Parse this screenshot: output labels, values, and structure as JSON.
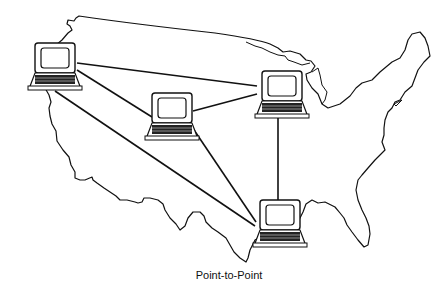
{
  "diagram": {
    "caption": "Point-to-Point",
    "map": "united-states-outline",
    "nodes": [
      {
        "id": "west",
        "label": "computer-west-coast",
        "x": 55,
        "y": 67
      },
      {
        "id": "central",
        "label": "computer-central",
        "x": 172,
        "y": 116
      },
      {
        "id": "northeast",
        "label": "computer-great-lakes",
        "x": 282,
        "y": 93
      },
      {
        "id": "south",
        "label": "computer-gulf-coast",
        "x": 280,
        "y": 225
      }
    ],
    "links": [
      [
        "west",
        "northeast"
      ],
      [
        "west",
        "central"
      ],
      [
        "west",
        "south"
      ],
      [
        "central",
        "northeast"
      ],
      [
        "central",
        "south"
      ],
      [
        "northeast",
        "south"
      ]
    ],
    "colors": {
      "line": "#111111",
      "background": "#ffffff"
    }
  }
}
